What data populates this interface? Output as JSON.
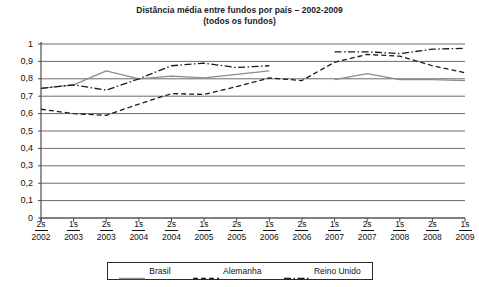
{
  "chart_data": {
    "type": "line",
    "title": "Distância média entre fundos por país – 2002-2009",
    "subtitle": "(todos os fundos)",
    "xlabel": "",
    "ylabel": "",
    "ylim": [
      0,
      1
    ],
    "ytick_step": 0.1,
    "grid": true,
    "decimal_separator": ",",
    "legend_position": "bottom",
    "categories": [
      "2s 2002",
      "1s 2003",
      "2s 2003",
      "1s 2004",
      "2s 2004",
      "1s 2005",
      "2s 2005",
      "1s 2006",
      "2s 2006",
      "1s 2007",
      "2s 2007",
      "1s 2008",
      "2s 2008",
      "1s 2009"
    ],
    "x_tick_labels": [
      {
        "semester": "2s",
        "year": "2002"
      },
      {
        "semester": "1s",
        "year": "2003"
      },
      {
        "semester": "2s",
        "year": "2003"
      },
      {
        "semester": "1s",
        "year": "2004"
      },
      {
        "semester": "2s",
        "year": "2004"
      },
      {
        "semester": "1s",
        "year": "2005"
      },
      {
        "semester": "2s",
        "year": "2005"
      },
      {
        "semester": "1s",
        "year": "2006"
      },
      {
        "semester": "2s",
        "year": "2006"
      },
      {
        "semester": "1s",
        "year": "2007"
      },
      {
        "semester": "2s",
        "year": "2007"
      },
      {
        "semester": "1s",
        "year": "2008"
      },
      {
        "semester": "2s",
        "year": "2008"
      },
      {
        "semester": "1s",
        "year": "2009"
      }
    ],
    "y_tick_labels": [
      "1",
      "0,9",
      "0,8",
      "0,7",
      "0,6",
      "0,5",
      "0,4",
      "0,3",
      "0,2",
      "0,1",
      "0"
    ],
    "y_tick_values": [
      1,
      0.9,
      0.8,
      0.7,
      0.6,
      0.5,
      0.4,
      0.3,
      0.2,
      0.1,
      0
    ],
    "series": [
      {
        "name": "Brasil",
        "style": "solid",
        "color": "#8c8c8c",
        "values": [
          0.745,
          0.765,
          0.845,
          0.8,
          0.815,
          0.805,
          0.825,
          0.845,
          null,
          0.795,
          0.83,
          0.795,
          0.795,
          0.79
        ]
      },
      {
        "name": "Alemanha",
        "style": "dashed",
        "color": "#1a1a1a",
        "values": [
          0.625,
          0.6,
          0.59,
          0.655,
          0.715,
          0.71,
          0.755,
          0.805,
          0.79,
          0.895,
          0.94,
          0.93,
          0.875,
          0.835
        ]
      },
      {
        "name": "Reino Unido",
        "style": "dash-dot",
        "color": "#1a1a1a",
        "values": [
          0.745,
          0.765,
          0.735,
          0.8,
          0.875,
          0.89,
          0.865,
          0.875,
          null,
          0.955,
          0.955,
          0.945,
          0.97,
          0.975
        ]
      }
    ]
  },
  "legend": {
    "items": [
      {
        "label": "Brasil",
        "style": "solid",
        "color": "#8c8c8c"
      },
      {
        "label": "Alemanha",
        "style": "dashed",
        "color": "#1a1a1a"
      },
      {
        "label": "Reino Unido",
        "style": "dash-dot",
        "color": "#1a1a1a"
      }
    ]
  },
  "colors": {
    "axis": "#4d4d4d",
    "grid": "#6b6b6b",
    "brasil": "#8c8c8c",
    "alemanha": "#1a1a1a",
    "reino_unido": "#1a1a1a",
    "text": "#111111",
    "background": "#ffffff"
  }
}
